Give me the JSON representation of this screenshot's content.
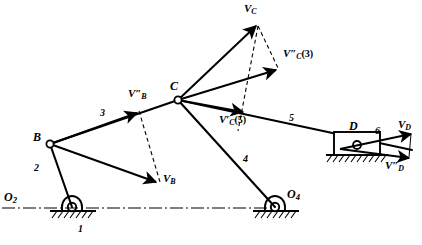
{
  "figure": {
    "type": "kinematic-linkage-velocity-diagram",
    "width": 422,
    "height": 245,
    "stroke_color": "#000000",
    "background_color": "#ffffff"
  },
  "joints": [
    {
      "name": "O2",
      "label_html": "O<sub>2</sub>",
      "x": 72,
      "y": 207,
      "kind": "fixed-pivot"
    },
    {
      "name": "B",
      "label_html": "B",
      "x": 50,
      "y": 144,
      "kind": "pin-joint"
    },
    {
      "name": "C",
      "label_html": "C",
      "x": 178,
      "y": 100,
      "kind": "pin-joint"
    },
    {
      "name": "O4",
      "label_html": "O<sub>4</sub>",
      "x": 275,
      "y": 207,
      "kind": "fixed-pivot"
    },
    {
      "name": "D",
      "label_html": "D",
      "x": 357,
      "y": 145,
      "kind": "slider-block"
    }
  ],
  "point_labels": [
    {
      "name": "label-O2",
      "text": "O₂",
      "base": "O",
      "sub": "2",
      "x": 4,
      "y": 196
    },
    {
      "name": "label-B",
      "text": "B",
      "base": "B",
      "sub": "",
      "x": 35,
      "y": 134
    },
    {
      "name": "label-C",
      "text": "C",
      "base": "C",
      "sub": "",
      "x": 172,
      "y": 82
    },
    {
      "name": "label-O4",
      "text": "O₄",
      "base": "O",
      "sub": "4",
      "x": 286,
      "y": 192
    },
    {
      "name": "label-D",
      "text": "D",
      "base": "D",
      "sub": "",
      "x": 349,
      "y": 125
    }
  ],
  "link_numbers": [
    {
      "name": "link-1",
      "text": "1",
      "x": 78,
      "y": 228,
      "desc": "ground-link-at-O2"
    },
    {
      "name": "link-2",
      "text": "2",
      "x": 36,
      "y": 168,
      "desc": "crank-O2-to-B"
    },
    {
      "name": "link-3",
      "text": "3",
      "x": 101,
      "y": 113,
      "desc": "coupler-B-to-C"
    },
    {
      "name": "link-4",
      "text": "4",
      "x": 244,
      "y": 158,
      "desc": "lever-C-to-O4"
    },
    {
      "name": "link-5",
      "text": "5",
      "x": 289,
      "y": 117,
      "desc": "coupler-C-to-D"
    },
    {
      "name": "link-6",
      "text": "6",
      "x": 375,
      "y": 130,
      "desc": "slider-D"
    }
  ],
  "vector_labels": [
    {
      "name": "label-v-b-double-prime",
      "base": "V",
      "primes": "″",
      "sub": "B",
      "suffix": "",
      "x": 129,
      "y": 92
    },
    {
      "name": "label-v-b",
      "base": "V",
      "primes": "",
      "sub": "B",
      "suffix": "",
      "x": 163,
      "y": 176
    },
    {
      "name": "label-v-c",
      "base": "V",
      "primes": "",
      "sub": "C",
      "suffix": "",
      "x": 245,
      "y": 4
    },
    {
      "name": "label-v-c-prime-3",
      "base": "V",
      "primes": "″",
      "sub": "C",
      "suffix": "(3)",
      "x": 285,
      "y": 52
    },
    {
      "name": "label-v-c-prime-5",
      "base": "V",
      "primes": "′",
      "sub": "C",
      "suffix": "(5)",
      "x": 220,
      "y": 117
    },
    {
      "name": "label-v-d",
      "base": "V",
      "primes": "",
      "sub": "D",
      "suffix": "",
      "x": 399,
      "y": 123
    },
    {
      "name": "label-v-d-double-prime",
      "base": "V",
      "primes": "″",
      "sub": "D",
      "suffix": "",
      "x": 386,
      "y": 163
    }
  ],
  "links": [
    {
      "name": "link-O2-B",
      "from": [
        72,
        207
      ],
      "to": [
        50,
        144
      ],
      "style": "solid",
      "width": 2.0
    },
    {
      "name": "link-B-C",
      "from": [
        50,
        144
      ],
      "to": [
        178,
        100
      ],
      "style": "solid",
      "width": 2.0
    },
    {
      "name": "link-C-O4",
      "from": [
        178,
        100
      ],
      "to": [
        275,
        207
      ],
      "style": "solid",
      "width": 2.0
    },
    {
      "name": "link-C-D",
      "from": [
        178,
        100
      ],
      "to": [
        410,
        150
      ],
      "style": "solid",
      "width": 2.0
    }
  ],
  "vectors": [
    {
      "name": "vector-v-b-double-prime",
      "from": [
        50,
        144
      ],
      "to": [
        139,
        113
      ],
      "style": "solid",
      "head": "filled"
    },
    {
      "name": "vector-v-b",
      "from": [
        50,
        144
      ],
      "to": [
        158,
        183
      ],
      "style": "solid",
      "head": "filled"
    },
    {
      "name": "vector-v-c",
      "from": [
        178,
        100
      ],
      "to": [
        258,
        24
      ],
      "style": "solid",
      "head": "filled"
    },
    {
      "name": "vector-v-c-prime-3",
      "from": [
        178,
        100
      ],
      "to": [
        278,
        70
      ],
      "style": "solid",
      "head": "filled"
    },
    {
      "name": "vector-v-c-prime-5",
      "from": [
        178,
        100
      ],
      "to": [
        245,
        112
      ],
      "style": "solid",
      "head": "filled"
    },
    {
      "name": "vector-v-d",
      "from": [
        340,
        149
      ],
      "to": [
        412,
        134
      ],
      "style": "solid",
      "head": "filled"
    },
    {
      "name": "vector-v-d-double-prime",
      "from": [
        340,
        149
      ],
      "to": [
        410,
        158
      ],
      "style": "solid",
      "head": "filled"
    }
  ],
  "construction_lines": [
    {
      "name": "dashed-vb-to-vbdp",
      "from": [
        139,
        113
      ],
      "to": [
        158,
        183
      ],
      "style": "dashed"
    },
    {
      "name": "dashed-vc-to-vcp3",
      "from": [
        258,
        24
      ],
      "to": [
        278,
        70
      ],
      "style": "dashed"
    },
    {
      "name": "dashed-vc-to-vcp5",
      "from": [
        258,
        24
      ],
      "to": [
        240,
        128
      ],
      "style": "dashed"
    },
    {
      "name": "centerline-O2-O4",
      "from": [
        78,
        208
      ],
      "to": [
        272,
        208
      ],
      "style": "dash-dot"
    }
  ],
  "ground_supports": [
    {
      "name": "ground-support-O2",
      "x": 72,
      "y": 207,
      "hatch_width": 46,
      "hatch_count": 7
    },
    {
      "name": "ground-support-O4",
      "x": 275,
      "y": 207,
      "hatch_width": 46,
      "hatch_count": 7
    },
    {
      "name": "ground-support-D",
      "x": 357,
      "y": 152,
      "hatch_width": 62,
      "hatch_count": 11
    }
  ],
  "slider": {
    "name": "slider-block-D",
    "x": 334,
    "y": 132,
    "width": 46,
    "height": 23
  }
}
